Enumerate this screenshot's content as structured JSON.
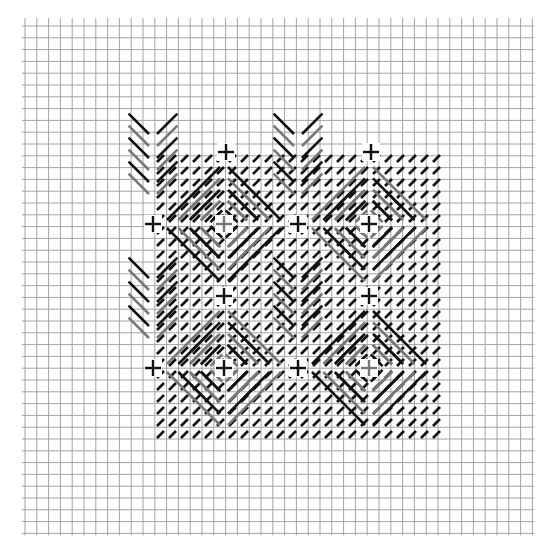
{
  "diagram": {
    "type": "stitch-grid",
    "grid": {
      "origin_x": 25,
      "origin_y": 26,
      "cell": 11.8,
      "cols": 43,
      "rows": 43,
      "line_color": "#9a9a9a"
    },
    "colors": {
      "dark": "#111111",
      "medium": "#777777",
      "marker_dark": "#111111",
      "marker_gray": "#777777"
    },
    "pattern_bounds_cells": {
      "col_start": 11,
      "row_start": 10,
      "col_end": 35,
      "row_end": 35
    },
    "markers": [
      {
        "x": 226,
        "y": 152,
        "color": "dark"
      },
      {
        "x": 371,
        "y": 152,
        "color": "dark"
      },
      {
        "x": 153,
        "y": 224,
        "color": "dark"
      },
      {
        "x": 224,
        "y": 224,
        "color": "medium"
      },
      {
        "x": 298,
        "y": 224,
        "color": "dark"
      },
      {
        "x": 369,
        "y": 224,
        "color": "dark"
      },
      {
        "x": 224,
        "y": 296,
        "color": "dark"
      },
      {
        "x": 369,
        "y": 296,
        "color": "dark"
      },
      {
        "x": 153,
        "y": 368,
        "color": "dark"
      },
      {
        "x": 224,
        "y": 368,
        "color": "dark"
      },
      {
        "x": 298,
        "y": 368,
        "color": "dark"
      },
      {
        "x": 369,
        "y": 368,
        "color": "medium"
      }
    ],
    "motif_centers": [
      {
        "cx": 224,
        "cy": 224,
        "style": "star-dark"
      },
      {
        "cx": 369,
        "cy": 224,
        "style": "star-medium"
      },
      {
        "cx": 224,
        "cy": 368,
        "style": "star-medium"
      },
      {
        "cx": 369,
        "cy": 368,
        "style": "star-dark"
      }
    ],
    "diamond_centers": [
      {
        "cx": 298,
        "cy": 152,
        "style": "chevron"
      },
      {
        "cx": 153,
        "cy": 296,
        "style": "chevron"
      },
      {
        "cx": 298,
        "cy": 296,
        "style": "diamond"
      },
      {
        "cx": 153,
        "cy": 152,
        "style": "chevron"
      }
    ]
  }
}
